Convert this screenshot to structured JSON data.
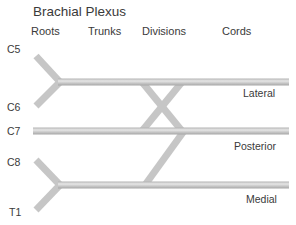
{
  "title": "Brachial Plexus",
  "headers": {
    "roots": "Roots",
    "trunks": "Trunks",
    "divisions": "Divisions",
    "cords": "Cords"
  },
  "roots": [
    "C5",
    "C6",
    "C7",
    "C8",
    "T1"
  ],
  "cords": {
    "lateral": "Lateral",
    "posterior": "Posterior",
    "medial": "Medial"
  },
  "colors": {
    "nerve": "#c8c8c8",
    "nerve_highlight": "#e4e4e4",
    "nerve_shadow": "#a8a8a8",
    "text": "#3a3a3a"
  },
  "diagram": {
    "nodes": [
      "C5",
      "C6",
      "C7",
      "C8",
      "T1",
      "Upper trunk",
      "Middle trunk",
      "Lower trunk",
      "Lateral cord",
      "Posterior cord",
      "Medial cord"
    ],
    "edges": [
      [
        "C5",
        "Upper trunk"
      ],
      [
        "C6",
        "Upper trunk"
      ],
      [
        "C7",
        "Middle trunk"
      ],
      [
        "C8",
        "Lower trunk"
      ],
      [
        "T1",
        "Lower trunk"
      ],
      [
        "Upper trunk",
        "Lateral cord"
      ],
      [
        "Upper trunk",
        "Posterior cord"
      ],
      [
        "Middle trunk",
        "Lateral cord"
      ],
      [
        "Middle trunk",
        "Posterior cord"
      ],
      [
        "Lower trunk",
        "Medial cord"
      ],
      [
        "Lower trunk",
        "Posterior cord"
      ]
    ]
  }
}
